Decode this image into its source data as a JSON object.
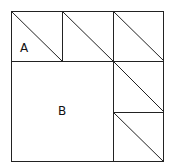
{
  "diagram": {
    "colors": {
      "line": "#222222",
      "background": "#ffffff",
      "text": "#111111"
    },
    "labels": [
      {
        "id": "A",
        "text": "A",
        "x": 25,
        "y": 52
      },
      {
        "id": "B",
        "text": "B",
        "x": 62,
        "y": 115
      }
    ],
    "outer": {
      "x": 11,
      "y": 11,
      "size": 153
    },
    "grid": {
      "cols": [
        11,
        62,
        113,
        164
      ],
      "rows": [
        11,
        61,
        112,
        162
      ]
    }
  }
}
